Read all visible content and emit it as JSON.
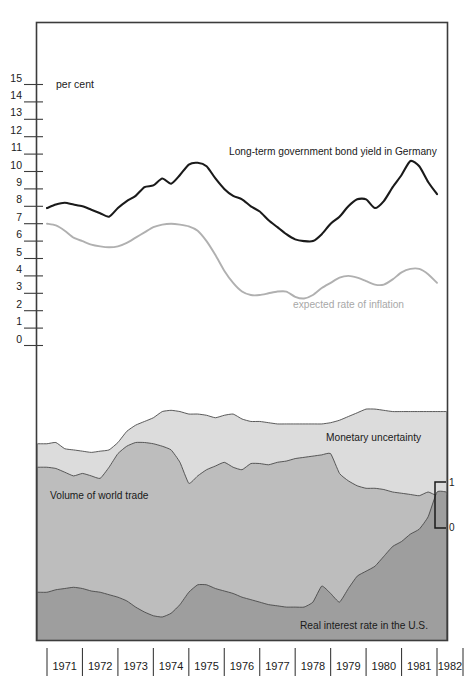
{
  "chart_data": {
    "type": "line",
    "title": "",
    "xlabel": "",
    "ylabel": "per cent",
    "ylim": [
      0,
      15
    ],
    "xlim": [
      1971,
      1982
    ],
    "grid": false,
    "legend_position": "inline-annotations",
    "axis_unit_label": "per cent",
    "y_ticks": [
      "0",
      "1",
      "2",
      "3",
      "4",
      "5",
      "6",
      "7",
      "8",
      "9",
      "10",
      "11",
      "12",
      "13",
      "14",
      "15"
    ],
    "x_ticks": [
      "1971",
      "1972",
      "1973",
      "1974",
      "1975",
      "1976",
      "1977",
      "1978",
      "1979",
      "1980",
      "1981",
      "1982"
    ],
    "secondary_axis": {
      "label": "index scale",
      "ticks": [
        "0",
        "1"
      ],
      "position": "right"
    },
    "panels": [
      {
        "name": "upper-panel",
        "type": "line",
        "ylim": [
          0,
          15
        ],
        "series": [
          {
            "name": "Long-term government bond yield in Germany",
            "color": "#1a1a1a",
            "label_x": 1974.6,
            "label_y": 11.35,
            "x": [
              1971.0,
              1971.25,
              1971.5,
              1971.75,
              1972.0,
              1972.25,
              1972.5,
              1972.75,
              1973.0,
              1973.25,
              1973.5,
              1973.75,
              1974.0,
              1974.25,
              1974.5,
              1974.75,
              1975.0,
              1975.25,
              1975.5,
              1975.75,
              1976.0,
              1976.25,
              1976.5,
              1976.75,
              1977.0,
              1977.25,
              1977.5,
              1977.75,
              1978.0,
              1978.25,
              1978.5,
              1978.75,
              1979.0,
              1979.25,
              1979.5,
              1979.75,
              1980.0,
              1980.25,
              1980.5,
              1980.75,
              1981.0,
              1981.25,
              1981.5,
              1981.75,
              1982.0
            ],
            "values": [
              7.9,
              8.1,
              8.2,
              8.1,
              8.0,
              7.8,
              7.6,
              7.4,
              7.9,
              8.3,
              8.6,
              9.1,
              9.2,
              9.6,
              9.3,
              9.8,
              10.4,
              10.5,
              10.3,
              9.6,
              9.0,
              8.6,
              8.4,
              8.0,
              7.7,
              7.2,
              6.8,
              6.4,
              6.1,
              6.0,
              6.0,
              6.4,
              7.0,
              7.4,
              8.0,
              8.4,
              8.4,
              7.9,
              8.3,
              9.1,
              9.8,
              10.6,
              10.3,
              9.4,
              8.7
            ]
          },
          {
            "name": "expected rate of inflation",
            "color": "#b0b0b0",
            "label_x": 1977.4,
            "label_y": 2.45,
            "x": [
              1971.0,
              1971.25,
              1971.5,
              1971.75,
              1972.0,
              1972.25,
              1972.5,
              1972.75,
              1973.0,
              1973.25,
              1973.5,
              1973.75,
              1974.0,
              1974.25,
              1974.5,
              1974.75,
              1975.0,
              1975.25,
              1975.5,
              1975.75,
              1976.0,
              1976.25,
              1976.5,
              1976.75,
              1977.0,
              1977.25,
              1977.5,
              1977.75,
              1978.0,
              1978.25,
              1978.5,
              1978.75,
              1979.0,
              1979.25,
              1979.5,
              1979.75,
              1980.0,
              1980.25,
              1980.5,
              1980.75,
              1981.0,
              1981.25,
              1981.5,
              1981.75,
              1982.0
            ],
            "values": [
              7.0,
              6.9,
              6.6,
              6.2,
              6.0,
              5.8,
              5.7,
              5.65,
              5.7,
              5.9,
              6.2,
              6.5,
              6.8,
              6.95,
              7.0,
              6.95,
              6.85,
              6.6,
              6.0,
              5.2,
              4.3,
              3.6,
              3.1,
              2.9,
              2.9,
              3.0,
              3.1,
              3.1,
              2.8,
              2.7,
              2.9,
              3.3,
              3.6,
              3.9,
              4.0,
              3.9,
              3.7,
              3.5,
              3.5,
              3.8,
              4.2,
              4.4,
              4.4,
              4.1,
              3.6
            ]
          }
        ]
      },
      {
        "name": "lower-panel",
        "type": "area",
        "stacked": true,
        "ylim": [
          0,
          1
        ],
        "series": [
          {
            "name": "Monetary uncertainty",
            "color": "#dcdcdc",
            "label_x": 1979.2,
            "label_y": 0.62,
            "x": [
              1971.0,
              1971.25,
              1971.5,
              1971.75,
              1972.0,
              1972.25,
              1972.5,
              1972.75,
              1973.0,
              1973.25,
              1973.5,
              1973.75,
              1974.0,
              1974.25,
              1974.5,
              1974.75,
              1975.0,
              1975.25,
              1975.5,
              1975.75,
              1976.0,
              1976.25,
              1976.5,
              1976.75,
              1977.0,
              1977.25,
              1977.5,
              1977.75,
              1978.0,
              1978.25,
              1978.5,
              1978.75,
              1979.0,
              1979.25,
              1979.5,
              1979.75,
              1980.0,
              1980.25,
              1980.5,
              1980.75,
              1981.0,
              1981.25,
              1981.5,
              1981.75,
              1982.0
            ],
            "top_values": [
              0.795,
              0.8,
              0.775,
              0.77,
              0.765,
              0.76,
              0.765,
              0.77,
              0.8,
              0.845,
              0.87,
              0.885,
              0.9,
              0.925,
              0.93,
              0.925,
              0.915,
              0.915,
              0.91,
              0.9,
              0.91,
              0.915,
              0.895,
              0.885,
              0.885,
              0.88,
              0.875,
              0.875,
              0.875,
              0.875,
              0.875,
              0.875,
              0.88,
              0.89,
              0.905,
              0.92,
              0.935,
              0.935,
              0.93,
              0.925,
              0.925,
              0.925,
              0.925,
              0.925,
              0.925
            ]
          },
          {
            "name": "Volume of world trade",
            "color": "#bdbdbd",
            "label_x": 1971.45,
            "label_y": 0.565,
            "x": [
              1971.0,
              1971.25,
              1971.5,
              1971.75,
              1972.0,
              1972.25,
              1972.5,
              1972.75,
              1973.0,
              1973.25,
              1973.5,
              1973.75,
              1974.0,
              1974.25,
              1974.5,
              1974.75,
              1975.0,
              1975.25,
              1975.5,
              1975.75,
              1976.0,
              1976.25,
              1976.5,
              1976.75,
              1977.0,
              1977.25,
              1977.5,
              1977.75,
              1978.0,
              1978.25,
              1978.5,
              1978.75,
              1979.0,
              1979.25,
              1979.5,
              1979.75,
              1980.0,
              1980.25,
              1980.5,
              1980.75,
              1981.0,
              1981.25,
              1981.5,
              1981.75,
              1982.0
            ],
            "top_values": [
              0.7,
              0.695,
              0.68,
              0.665,
              0.675,
              0.665,
              0.655,
              0.7,
              0.755,
              0.785,
              0.8,
              0.8,
              0.795,
              0.785,
              0.77,
              0.72,
              0.635,
              0.665,
              0.69,
              0.705,
              0.72,
              0.7,
              0.69,
              0.715,
              0.715,
              0.71,
              0.72,
              0.725,
              0.735,
              0.74,
              0.745,
              0.75,
              0.755,
              0.675,
              0.645,
              0.625,
              0.615,
              0.615,
              0.61,
              0.6,
              0.595,
              0.59,
              0.585,
              0.6,
              0.585
            ]
          },
          {
            "name": "Real interest rate in the U.S.",
            "color": "#9e9e9e",
            "label_x": 1978.6,
            "label_y": 0.085,
            "x": [
              1971.0,
              1971.25,
              1971.5,
              1971.75,
              1972.0,
              1972.25,
              1972.5,
              1972.75,
              1973.0,
              1973.25,
              1973.5,
              1973.75,
              1974.0,
              1974.25,
              1974.5,
              1974.75,
              1975.0,
              1975.25,
              1975.5,
              1975.75,
              1976.0,
              1976.25,
              1976.5,
              1976.75,
              1977.0,
              1977.25,
              1977.5,
              1977.75,
              1978.0,
              1978.25,
              1978.5,
              1978.75,
              1979.0,
              1979.25,
              1979.5,
              1979.75,
              1980.0,
              1980.25,
              1980.5,
              1980.75,
              1981.0,
              1981.25,
              1981.5,
              1981.75,
              1982.0
            ],
            "top_values": [
              0.195,
              0.205,
              0.21,
              0.215,
              0.21,
              0.2,
              0.195,
              0.185,
              0.175,
              0.16,
              0.135,
              0.115,
              0.1,
              0.095,
              0.11,
              0.145,
              0.195,
              0.225,
              0.225,
              0.21,
              0.2,
              0.19,
              0.175,
              0.165,
              0.155,
              0.145,
              0.14,
              0.135,
              0.135,
              0.135,
              0.155,
              0.22,
              0.19,
              0.155,
              0.21,
              0.26,
              0.28,
              0.3,
              0.34,
              0.38,
              0.4,
              0.43,
              0.45,
              0.5,
              0.6
            ]
          }
        ]
      }
    ]
  },
  "axis": {
    "unit_label": "per cent",
    "y_ticks": [
      "15",
      "14",
      "13",
      "12",
      "11",
      "10",
      "9",
      "8",
      "7",
      "6",
      "5",
      "4",
      "3",
      "2",
      "1",
      "0"
    ],
    "x_ticks": [
      "1971",
      "1972",
      "1973",
      "1974",
      "1975",
      "1976",
      "1977",
      "1978",
      "1979",
      "1980",
      "1981",
      "1982"
    ],
    "bracket_top": "1",
    "bracket_bottom": "0"
  },
  "labels": {
    "bond_yield": "Long-term government bond yield in Germany",
    "expected_inflation": "expected rate of inflation",
    "monetary_uncertainty": "Monetary uncertainty",
    "world_trade": "Volume of world trade",
    "real_interest": "Real interest rate in the U.S."
  },
  "colors": {
    "frame": "#3c3c3c",
    "bond_line": "#1a1a1a",
    "inflation_line": "#b0b0b0",
    "band_top": "#dcdcdc",
    "band_mid": "#bdbdbd",
    "band_bottom": "#9e9e9e",
    "background": "#ffffff"
  }
}
